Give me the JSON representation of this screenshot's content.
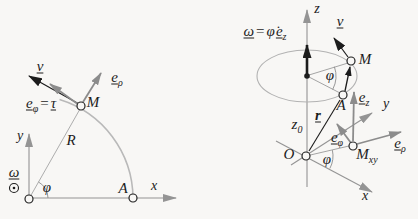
{
  "figure_title": "circular-motion-polar-and-cylindrical-coordinates",
  "colors": {
    "ink": "#1c1c1c",
    "axis_gray": "#949494",
    "unit_vector_gray": "#8c8c8c",
    "path_gray": "#b9b9b9",
    "paper": "#f8f7f5"
  },
  "left": {
    "v": "v",
    "e": "e",
    "phi": "φ",
    "tau": "τ",
    "eq": "=",
    "rho": "ρ",
    "M": "M",
    "R": "R",
    "A": "A",
    "x": "x",
    "y": "y",
    "omega": "ω"
  },
  "right": {
    "z": "z",
    "zero": "0",
    "v": "v",
    "M": "M",
    "xy": "xy",
    "A": "A",
    "O": "O",
    "r": "r",
    "x": "x",
    "y": "y",
    "omega": "ω",
    "eq": "=",
    "phi_dot": "φ̇",
    "e": "e",
    "phi": "φ",
    "rho": "ρ"
  }
}
